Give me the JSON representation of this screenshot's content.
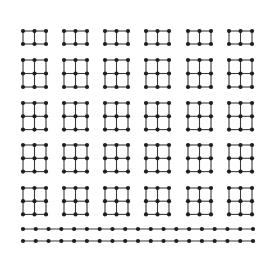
{
  "diagram": {
    "type": "grid-graph-enumeration",
    "background": "#ffffff",
    "edge_color": "#3a3a3a",
    "node_color": "#1e1e1e",
    "node_radius": 2.1,
    "column_x": [
      23,
      64,
      105,
      146,
      188,
      229
    ],
    "cell_w": 11.5,
    "rows": [
      {
        "name": "row-1-grid-2x3",
        "node_rows": 2,
        "node_cols": 3,
        "top_y": 31,
        "cell_h": 13
      },
      {
        "name": "row-2-grid-3x3",
        "node_rows": 3,
        "node_cols": 3,
        "top_y": 60,
        "cell_h": 13.5
      },
      {
        "name": "row-3-grid-3x3",
        "node_rows": 3,
        "node_cols": 3,
        "top_y": 103,
        "cell_h": 13.3
      },
      {
        "name": "row-4-grid-3x3",
        "node_rows": 3,
        "node_cols": 3,
        "top_y": 145,
        "cell_h": 13.3
      },
      {
        "name": "row-5-grid-3x3",
        "node_rows": 3,
        "node_cols": 3,
        "top_y": 188,
        "cell_h": 13.2
      }
    ],
    "chains": [
      {
        "name": "chain-1",
        "y": 229,
        "x_start": 23,
        "x_end": 253,
        "nodes": 19
      },
      {
        "name": "chain-2",
        "y": 241,
        "x_start": 23,
        "x_end": 253,
        "nodes": 19
      }
    ]
  }
}
